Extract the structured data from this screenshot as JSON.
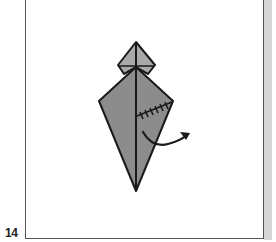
{
  "step": {
    "number": "14"
  },
  "colors": {
    "background": "#ffffff",
    "frame_border": "#555555",
    "frame_shadow": "#d6d6d6",
    "paper_body": "#8c8c8c",
    "paper_head": "#a9a9a9",
    "line": "#1a1a1a"
  },
  "diagram": {
    "symbols": [
      "center-crease",
      "hidden-edge-zigzag",
      "fold-arrow"
    ]
  }
}
